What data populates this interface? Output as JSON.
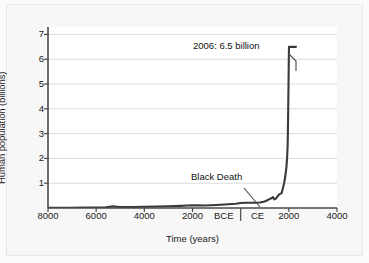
{
  "chart_data": {
    "type": "line",
    "title": "",
    "xlabel": "Time (years)",
    "ylabel": "Human population (billions)",
    "xlim": [
      -8000,
      4000
    ],
    "ylim": [
      0,
      7.3
    ],
    "grid": true,
    "legend": null,
    "x_tick_labels": [
      "8000",
      "6000",
      "4000",
      "2000",
      "BCE",
      "CE",
      "2000",
      "4000"
    ],
    "x_tick_values": [
      -8000,
      -6000,
      -4000,
      -2000,
      -700,
      700,
      2000,
      4000
    ],
    "y_tick_labels": [
      "1",
      "2",
      "3",
      "4",
      "5",
      "6",
      "7"
    ],
    "y_tick_values": [
      1,
      2,
      3,
      4,
      5,
      6,
      7
    ],
    "era_divider_value": 0,
    "line_color": "#3a3a3a",
    "grid_color": "#dcdcdc",
    "axis_color": "#4a4a4a",
    "series": [
      {
        "name": "Human population",
        "x": [
          -8000,
          -7500,
          -7000,
          -6500,
          -6000,
          -5600,
          -5400,
          -5300,
          -5200,
          -5000,
          -4800,
          -4500,
          -4000,
          -3500,
          -3000,
          -2500,
          -2200,
          -2000,
          -1800,
          -1500,
          -1000,
          -500,
          -200,
          0,
          200,
          400,
          600,
          800,
          1000,
          1200,
          1300,
          1340,
          1400,
          1450,
          1500,
          1600,
          1700,
          1750,
          1800,
          1850,
          1900,
          1927,
          1950,
          1960,
          1974,
          1987,
          1999,
          2006
        ],
        "y": [
          0.005,
          0.008,
          0.012,
          0.016,
          0.02,
          0.03,
          0.055,
          0.07,
          0.055,
          0.035,
          0.035,
          0.04,
          0.05,
          0.06,
          0.07,
          0.085,
          0.1,
          0.11,
          0.105,
          0.1,
          0.12,
          0.15,
          0.17,
          0.2,
          0.21,
          0.21,
          0.21,
          0.22,
          0.26,
          0.36,
          0.4,
          0.44,
          0.35,
          0.37,
          0.43,
          0.55,
          0.6,
          0.79,
          0.98,
          1.26,
          1.65,
          2.0,
          2.5,
          3.0,
          4.0,
          5.0,
          6.0,
          6.5
        ]
      }
    ],
    "annotations": [
      {
        "id": "peak",
        "text": "2006: 6.5 billion",
        "x": 2006,
        "y": 6.5
      },
      {
        "id": "black_death",
        "text": "Black Death",
        "x": 1340,
        "y": 0.44
      }
    ]
  },
  "figure": {
    "y_axis_title": "Human population (billions)",
    "x_axis_title": "Time (years)",
    "annotation_peak": "2006: 6.5 billion",
    "annotation_black_death": "Black Death"
  }
}
